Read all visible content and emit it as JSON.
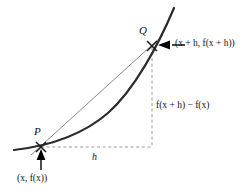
{
  "figure": {
    "type": "secant-line-difference-quotient-diagram",
    "background_color": "#ffffff",
    "width": 248,
    "height": 195
  },
  "labels": {
    "point_p": "P",
    "point_q": "Q",
    "run": "h",
    "p_coordinates": "(x, f(x))",
    "q_coordinates": "(x + h, f(x + h))",
    "rise": "f(x + h) − f(x)"
  },
  "colors": {
    "curve": "#2b2b2b",
    "secant": "#8a8a8a",
    "dashed": "#9a9a9a",
    "arrow": "#000000",
    "text": "#111111"
  },
  "geometry": {
    "point_p": [
      41,
      147
    ],
    "point_q": [
      152,
      46
    ],
    "curve_start": [
      14,
      150
    ],
    "curve_end": [
      174,
      8
    ],
    "secant_start": [
      31,
      155
    ],
    "secant_end": [
      163,
      35
    ],
    "dashed_vertical_x": 152,
    "dashed_horizontal_y": 147
  }
}
